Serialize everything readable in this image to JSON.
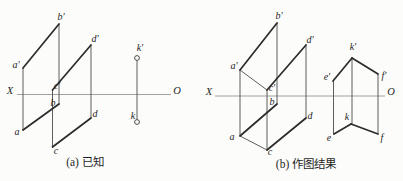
{
  "colors": {
    "background": "#fcfcfa",
    "thick_line": "#2b2b2b",
    "thin_line": "#4d4d4d",
    "axis_line": "#979797",
    "label": "#1f1f1f"
  },
  "panels": {
    "a": {
      "caption": "(a) 已知",
      "axis_labels": {
        "x": "X",
        "o": "O"
      },
      "point_labels": {
        "a_prime": "a′",
        "b_prime": "b′",
        "c_prime": "c′",
        "d_prime": "d′",
        "a": "a",
        "b": "b",
        "c": "c",
        "d": "d",
        "k_prime": "k′",
        "k": "k"
      }
    },
    "b": {
      "caption": "(b) 作图结果",
      "axis_labels": {
        "x": "X",
        "o": "O"
      },
      "point_labels": {
        "a_prime": "a′",
        "b_prime": "b′",
        "c_prime": "c′",
        "d_prime": "d′",
        "a": "a",
        "b": "b",
        "c": "c",
        "d": "d",
        "e_prime": "e′",
        "k_prime": "k′",
        "f_prime": "f′",
        "e": "e",
        "k": "k",
        "f": "f"
      }
    }
  }
}
